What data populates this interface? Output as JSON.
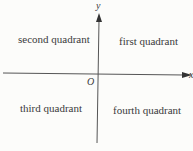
{
  "diagram": {
    "axes": {
      "x_label": "x",
      "y_label": "y",
      "origin_label": "O"
    },
    "quadrants": {
      "first": "first quadrant",
      "second": "second quadrant",
      "third": "third quadrant",
      "fourth": "fourth quadrant"
    }
  }
}
